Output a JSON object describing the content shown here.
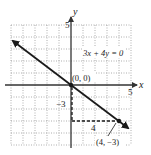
{
  "graph": {
    "equation": "3x + 4y = 0",
    "axes": {
      "x_label": "x",
      "y_label": "y",
      "x_tick_label": "5",
      "y_tick_label": "5",
      "x_range": [
        -5,
        5
      ],
      "y_range": [
        -5,
        5
      ]
    },
    "points": [
      {
        "label": "(0, 0)",
        "x": 0,
        "y": 0
      },
      {
        "label": "(4, −3)",
        "x": 4,
        "y": -3
      }
    ],
    "slope_triangle": {
      "rise_label": "−3",
      "run_label": "4"
    },
    "colors": {
      "line": "#1a1a1a",
      "grid": "#9a9a9a",
      "axis": "#333333"
    }
  }
}
